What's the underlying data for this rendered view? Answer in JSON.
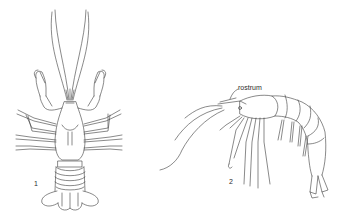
{
  "figure": {
    "stroke_color": "#3a3a3a",
    "background": "#ffffff",
    "specimens": [
      {
        "id": "crayfish",
        "number_label": "1",
        "view": "dorsal"
      },
      {
        "id": "shrimp",
        "number_label": "2",
        "view": "lateral",
        "annotation": "rostrum"
      }
    ]
  }
}
